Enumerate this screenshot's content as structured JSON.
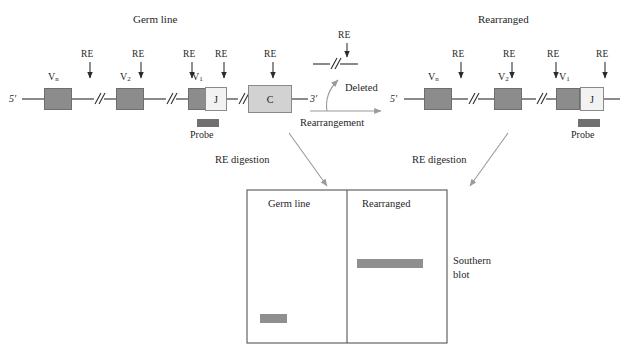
{
  "figure": {
    "type": "molecular-biology-diagram",
    "topic": "Immunoglobulin gene rearrangement detected by Southern blot"
  },
  "colors": {
    "v_segment": "#8c8c8c",
    "j_segment": "#f2f2f2",
    "c_segment": "#d2d2d2",
    "probe": "#707070",
    "band": "#8f8f8f",
    "line": "#2b2b2b",
    "arrow_gray": "#9a9a9a",
    "box_border": "#6e6e6e",
    "text": "#1f1f1f"
  },
  "germline": {
    "title": "Germ line",
    "five_prime": "5′",
    "three_prime": "3′",
    "re_label": "RE",
    "re_sites": [
      "RE",
      "RE",
      "RE",
      "RE",
      "RE"
    ],
    "segments": [
      {
        "label": "V",
        "sub": "n",
        "kind": "v"
      },
      {
        "label": "V",
        "sub": "2",
        "kind": "v"
      },
      {
        "label": "V",
        "sub": "1",
        "kind": "v"
      },
      {
        "label": "J",
        "sub": "",
        "kind": "j"
      },
      {
        "label": "C",
        "sub": "",
        "kind": "c"
      }
    ],
    "probe_label": "Probe"
  },
  "middle": {
    "rearrangement_label": "Rearrangement",
    "deleted_label": "Deleted",
    "deleted_re_label": "RE"
  },
  "rearranged": {
    "title": "Rearranged",
    "five_prime": "5′",
    "three_prime": "3′",
    "re_label": "RE",
    "re_sites": [
      "RE",
      "RE",
      "RE",
      "RE"
    ],
    "segments": [
      {
        "label": "V",
        "sub": "n",
        "kind": "v"
      },
      {
        "label": "V",
        "sub": "2",
        "kind": "v"
      },
      {
        "label": "V",
        "sub": "1",
        "kind": "v"
      },
      {
        "label": "J",
        "sub": "",
        "kind": "j"
      },
      {
        "label": "C",
        "sub": "",
        "kind": "c"
      }
    ],
    "probe_label": "Probe"
  },
  "digestion": {
    "left_label": "RE digestion",
    "right_label": "RE digestion"
  },
  "blot": {
    "lane_left_label": "Germ line",
    "lane_right_label": "Rearranged",
    "caption_line1": "Southern",
    "caption_line2": "blot",
    "bands": [
      {
        "lane": "germ line",
        "position": "low",
        "width_px": 24
      },
      {
        "lane": "rearranged",
        "position": "high",
        "width_px": 65
      }
    ]
  }
}
